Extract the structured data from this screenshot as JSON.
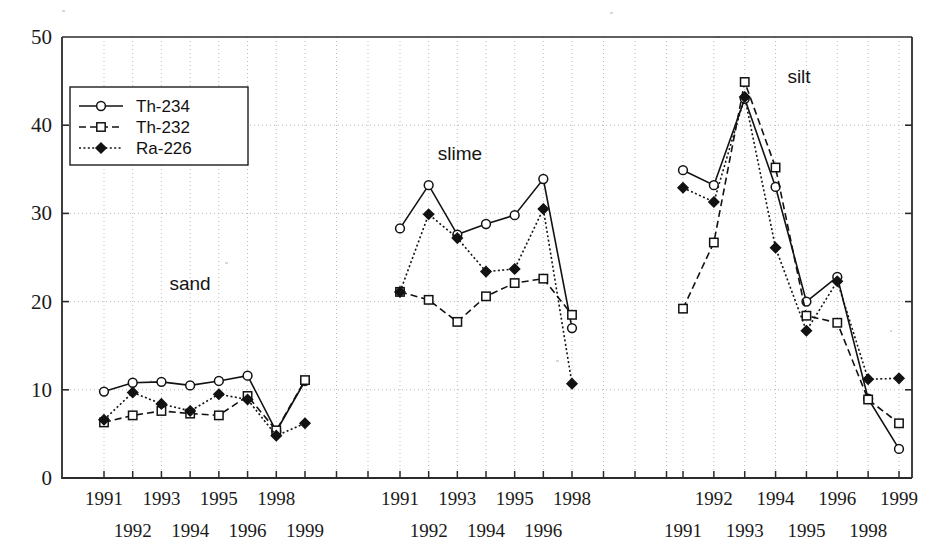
{
  "chart_data": {
    "type": "line",
    "title": "",
    "xlabel": "",
    "ylabel": "",
    "ylim": [
      0,
      50
    ],
    "yticks": [
      0,
      10,
      20,
      30,
      40,
      50
    ],
    "grid": true,
    "legend_position": "upper-left-inside",
    "legend": [
      "Th-234",
      "Th-232",
      "Ra-226"
    ],
    "panels": [
      {
        "name": "sand",
        "label": "sand",
        "categories": [
          "1991",
          "1992",
          "1993",
          "1994",
          "1995",
          "1996",
          "1998",
          "1999"
        ],
        "series": [
          {
            "name": "Th-234",
            "marker": "open-circle",
            "line": "solid",
            "values": [
              9.8,
              10.8,
              10.9,
              10.5,
              11.0,
              11.6,
              5.3,
              11.0
            ]
          },
          {
            "name": "Th-232",
            "marker": "open-square",
            "line": "dashed",
            "values": [
              6.3,
              7.1,
              7.6,
              7.3,
              7.1,
              9.3,
              5.4,
              11.1
            ]
          },
          {
            "name": "Ra-226",
            "marker": "filled-diamond",
            "line": "dotted",
            "values": [
              6.6,
              9.7,
              8.4,
              7.6,
              9.5,
              8.9,
              4.8,
              6.2
            ]
          }
        ]
      },
      {
        "name": "slime",
        "label": "slime",
        "categories": [
          "1991",
          "1992",
          "1993",
          "1994",
          "1995",
          "1996",
          "1998"
        ],
        "series": [
          {
            "name": "Th-234",
            "marker": "open-circle",
            "line": "solid",
            "values": [
              28.3,
              33.2,
              27.6,
              28.8,
              29.8,
              33.9,
              17.0
            ]
          },
          {
            "name": "Th-232",
            "marker": "open-square",
            "line": "dashed",
            "values": [
              21.1,
              20.2,
              17.7,
              20.6,
              22.1,
              22.6,
              18.5
            ]
          },
          {
            "name": "Ra-226",
            "marker": "filled-diamond",
            "line": "dotted",
            "values": [
              21.1,
              29.9,
              27.2,
              23.4,
              23.7,
              30.5,
              10.7
            ]
          }
        ]
      },
      {
        "name": "silt",
        "label": "silt",
        "categories": [
          "1991",
          "1992",
          "1993",
          "1994",
          "1995",
          "1996",
          "1998",
          "1999"
        ],
        "series": [
          {
            "name": "Th-234",
            "marker": "open-circle",
            "line": "solid",
            "values": [
              34.9,
              33.2,
              43.0,
              33.0,
              20.0,
              22.8,
              9.0,
              3.3
            ]
          },
          {
            "name": "Th-232",
            "marker": "open-square",
            "line": "dashed",
            "values": [
              19.2,
              26.7,
              44.9,
              35.2,
              18.4,
              17.6,
              8.9,
              6.2
            ]
          },
          {
            "name": "Ra-226",
            "marker": "filled-diamond",
            "line": "dotted",
            "values": [
              32.9,
              31.3,
              43.2,
              26.1,
              16.7,
              22.3,
              11.2,
              11.3
            ]
          }
        ]
      }
    ]
  }
}
